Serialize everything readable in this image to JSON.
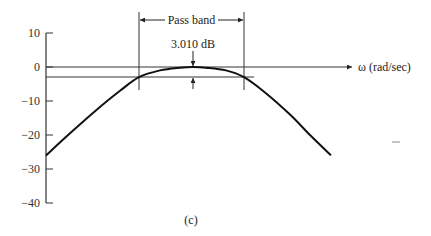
{
  "chart_data": {
    "type": "line",
    "title": "",
    "caption": "(c)",
    "xlabel": "ω (rad/sec)",
    "ylabel": "",
    "ylim": [
      -40,
      10
    ],
    "yticks": [
      10,
      0,
      -10,
      -20,
      -30,
      -40
    ],
    "ytick_labels": [
      "10",
      "0",
      "−10",
      "−20",
      "−30",
      "−40"
    ],
    "grid": false,
    "legend": null,
    "series": [
      {
        "name": "magnitude response (dB)",
        "x_px": [
          46,
          70,
          95,
          120,
          139,
          160,
          180,
          193,
          206,
          226,
          244,
          265,
          290,
          310,
          331
        ],
        "values": [
          -26,
          -19.5,
          -13,
          -7,
          -3,
          -1,
          -0.2,
          0,
          -0.2,
          -1,
          -3,
          -7.5,
          -14,
          -20,
          -26
        ]
      }
    ],
    "reference_lines": [
      {
        "label": "0 dB",
        "value": 0
      },
      {
        "label": "-3 dB",
        "value": -3.01
      }
    ],
    "annotations": {
      "pass_band": "Pass band",
      "attenuation": "3.010 dB"
    }
  }
}
